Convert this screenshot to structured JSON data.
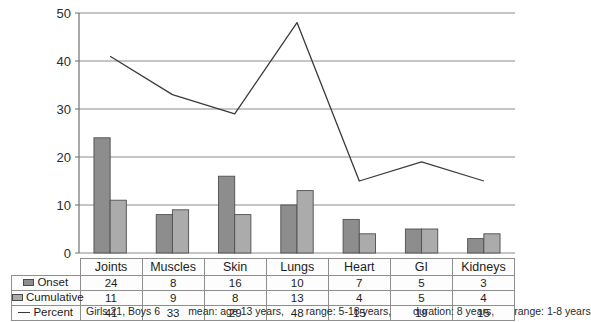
{
  "chart_data": {
    "type": "bar",
    "title": "",
    "xlabel": "",
    "ylabel": "",
    "ylim": [
      0,
      50
    ],
    "yticks": [
      0,
      10,
      20,
      30,
      40,
      50
    ],
    "grid": true,
    "legend_position": "table-left",
    "categories": [
      "Joints",
      "Muscles",
      "Skin",
      "Lungs",
      "Heart",
      "GI",
      "Kidneys"
    ],
    "series": [
      {
        "name": "Onset",
        "type": "bar",
        "color": "#8d8d8d",
        "values": [
          24,
          8,
          16,
          10,
          7,
          5,
          3
        ]
      },
      {
        "name": "Cumulative",
        "type": "bar",
        "color": "#ababab",
        "values": [
          11,
          9,
          8,
          13,
          4,
          5,
          4
        ]
      },
      {
        "name": "Percent",
        "type": "line",
        "color": "#3a3a3a",
        "values": [
          41,
          33,
          29,
          48,
          15,
          19,
          15
        ]
      }
    ]
  },
  "axis": {
    "y_tick_labels": [
      "50",
      "40",
      "30",
      "20",
      "10",
      "0"
    ]
  },
  "table": {
    "corner_label": "",
    "category_headers": [
      "Joints",
      "Muscles",
      "Skin",
      "Lungs",
      "Heart",
      "GI",
      "Kidneys"
    ],
    "rows": [
      {
        "label": "Onset",
        "swatch": "onset-swatch-icon",
        "values": [
          "24",
          "8",
          "16",
          "10",
          "7",
          "5",
          "3"
        ]
      },
      {
        "label": "Cumulative",
        "swatch": "cumulative-swatch-icon",
        "values": [
          "11",
          "9",
          "8",
          "13",
          "4",
          "5",
          "4"
        ]
      },
      {
        "label": "Percent",
        "swatch": "percent-line-icon",
        "values": [
          "41",
          "33",
          "29",
          "48",
          "15",
          "19",
          "15"
        ]
      }
    ]
  },
  "footer": {
    "items": [
      "Girls 21, Boys 6",
      "mean: age 13 years,",
      "range: 5-18 years,",
      "duration: 8 years,",
      "range: 1-8 years"
    ]
  },
  "colors": {
    "onset_bar": "#8d8d8d",
    "cumulative_bar": "#ababab",
    "bar_stroke": "#4f4f4f",
    "line": "#3a3a3a",
    "grid": "#8c8c8c",
    "axis": "#6f6f6f",
    "table_border": "#8e8e8e",
    "background": "#ffffff"
  }
}
